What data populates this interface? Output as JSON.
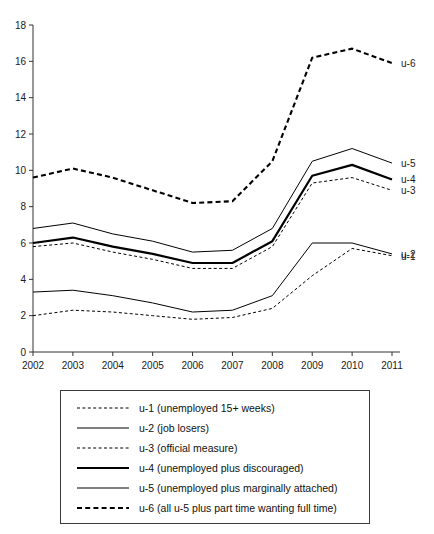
{
  "figure": {
    "cut_off_top_text": "",
    "legend_position": "below-plot",
    "grid": false
  },
  "chart_data": {
    "type": "line",
    "title": "",
    "subtitle": "",
    "xlabel": "",
    "ylabel": "",
    "xlim": [
      2002,
      2011
    ],
    "ylim": [
      0,
      18
    ],
    "ytick_step": 2,
    "yticks": [
      0,
      2,
      4,
      6,
      8,
      10,
      12,
      14,
      16,
      18
    ],
    "categories": [
      "2002",
      "2003",
      "2004",
      "2005",
      "2006",
      "2007",
      "2008",
      "2009",
      "2010",
      "2011"
    ],
    "x": [
      2002,
      2003,
      2004,
      2005,
      2006,
      2007,
      2008,
      2009,
      2010,
      2011
    ],
    "series": [
      {
        "name": "u-1",
        "end_label": "u-1",
        "legend_label": "u-1 (unemployed 15+ weeks)",
        "style": "dashed-thin",
        "values": [
          2.0,
          2.3,
          2.2,
          2.0,
          1.8,
          1.9,
          2.4,
          4.2,
          5.7,
          5.3
        ]
      },
      {
        "name": "u-2",
        "end_label": "u-2",
        "legend_label": "u-2 (job losers)",
        "style": "solid-thin",
        "values": [
          3.3,
          3.4,
          3.1,
          2.7,
          2.2,
          2.3,
          3.1,
          6.0,
          6.0,
          5.4
        ]
      },
      {
        "name": "u-3",
        "end_label": "u-3",
        "legend_label": "u-3 (official measure)",
        "style": "dashed-thin",
        "values": [
          5.8,
          6.0,
          5.5,
          5.1,
          4.6,
          4.6,
          5.8,
          9.3,
          9.6,
          8.9
        ]
      },
      {
        "name": "u-4",
        "end_label": "u-4",
        "legend_label": "u-4 (unemployed plus discouraged)",
        "style": "solid-thick",
        "values": [
          6.0,
          6.3,
          5.8,
          5.4,
          4.9,
          4.9,
          6.1,
          9.7,
          10.3,
          9.5
        ]
      },
      {
        "name": "u-5",
        "end_label": "u-5",
        "legend_label": "u-5 (unemployed plus marginally attached)",
        "style": "solid-thin",
        "values": [
          6.8,
          7.1,
          6.5,
          6.1,
          5.5,
          5.6,
          6.8,
          10.5,
          11.2,
          10.4
        ]
      },
      {
        "name": "u-6",
        "end_label": "u-6",
        "legend_label": "u-6 (all u-5 plus part time wanting full time)",
        "style": "dashed-thick",
        "values": [
          9.6,
          10.1,
          9.6,
          8.9,
          8.2,
          8.3,
          10.5,
          16.2,
          16.7,
          15.9
        ]
      }
    ]
  },
  "colors": {
    "line": "#000000",
    "axis": "#333333",
    "text": "#1a1a1a",
    "legend_border": "#3a3a3a",
    "background": "#ffffff"
  }
}
